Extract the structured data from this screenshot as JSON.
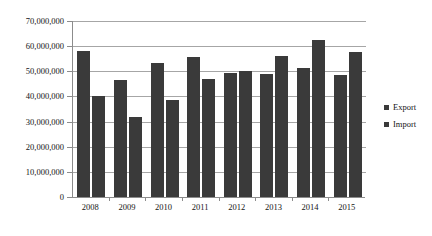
{
  "chart_data": {
    "type": "bar",
    "title": "",
    "xlabel": "",
    "ylabel": "",
    "categories": [
      "2008",
      "2009",
      "2010",
      "2011",
      "2012",
      "2013",
      "2014",
      "2015"
    ],
    "series": [
      {
        "name": "Export",
        "values": [
          58000000,
          46500000,
          53500000,
          55500000,
          49500000,
          49000000,
          51500000,
          48500000
        ]
      },
      {
        "name": "Import",
        "values": [
          40000000,
          32000000,
          38500000,
          47000000,
          50000000,
          56000000,
          62500000,
          57500000
        ]
      }
    ],
    "ylim": [
      0,
      70000000
    ],
    "ytick_values": [
      0,
      10000000,
      20000000,
      30000000,
      40000000,
      50000000,
      60000000,
      70000000
    ],
    "ytick_labels": [
      "0",
      "10,000,000",
      "20,000,000",
      "30,000,000",
      "40,000,000",
      "50,000,000",
      "60,000,000",
      "70,000,000"
    ],
    "grid": true,
    "legend_position": "right",
    "bar_color": "#3a3a3a",
    "gridline_color": "#a6a6a6",
    "axis_color": "#8c8c8c",
    "background_color": "#ffffff"
  }
}
